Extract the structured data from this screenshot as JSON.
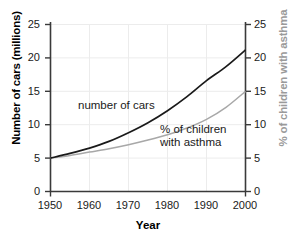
{
  "chart_data": {
    "type": "line",
    "title": "",
    "xlabel": "Year",
    "ylabel": "Number of cars (millions)",
    "ylabel_right": "% of children with asthma",
    "x": [
      1950,
      1955,
      1960,
      1965,
      1970,
      1975,
      1980,
      1985,
      1990,
      1995,
      2000
    ],
    "xlim": [
      1950,
      2000
    ],
    "ylim": [
      0,
      25
    ],
    "ylim_right": [
      0,
      25
    ],
    "xticks": [
      "1950",
      "1960",
      "1970",
      "1980",
      "1990",
      "2000"
    ],
    "yticks": [
      "0",
      "5",
      "10",
      "15",
      "20",
      "25"
    ],
    "yticks_right": [
      "0",
      "5",
      "10",
      "15",
      "20",
      "25"
    ],
    "grid": true,
    "legend": "inline-annotations",
    "series": [
      {
        "name": "number of cars",
        "axis": "left",
        "color": "#1a1a1a",
        "values": [
          5.0,
          5.7,
          6.5,
          7.5,
          8.8,
          10.3,
          12.1,
          14.2,
          16.6,
          18.7,
          21.2
        ]
      },
      {
        "name": "% of children with asthma",
        "axis": "right",
        "color": "#a8a8a8",
        "values": [
          5.0,
          5.4,
          5.9,
          6.4,
          7.0,
          7.7,
          8.5,
          9.5,
          10.8,
          12.6,
          15.0
        ]
      }
    ],
    "annotations": [
      {
        "id": "label-cars",
        "text": "number of cars",
        "color": "#1a1a1a"
      },
      {
        "id": "label-asthma",
        "line1": "% of children",
        "line2": "with asthma",
        "color": "#1a1a1a"
      }
    ]
  },
  "colors": {
    "axis": "#3a3a3a",
    "grid": "#e8e8e8",
    "cars_line": "#1a1a1a",
    "asthma_line": "#a8a8a8",
    "right_axis_title": "#9a9a9a",
    "background": "#ffffff"
  }
}
